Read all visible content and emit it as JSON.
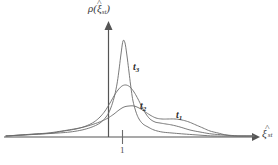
{
  "figure": {
    "background_color": "#ffffff",
    "line_color": "#6b6b6b",
    "axis_color": "#555555",
    "text_color": "#3b3b3b"
  },
  "axes": {
    "y": {
      "label_rho": "ρ(",
      "label_xi": "ξ",
      "label_hat": "˄",
      "label_sub": "st",
      "label_close": ")",
      "arrow": "up-arrow"
    },
    "x": {
      "label_xi": "ξ",
      "label_hat": "˄",
      "label_sub": "st",
      "arrow": "right-arrow"
    }
  },
  "ticks": {
    "x": [
      {
        "label": "1",
        "position": 122
      }
    ]
  },
  "curve_labels": [
    {
      "name": "t3",
      "base": "t",
      "sub": "3"
    },
    {
      "name": "t2",
      "base": "t",
      "sub": "2"
    },
    {
      "name": "t1",
      "base": "t",
      "sub": "1"
    }
  ],
  "chart_data": {
    "type": "line",
    "title": "",
    "subtitle": "",
    "xlabel": "ξ̂_st",
    "ylabel": "ρ(ξ̂_st)",
    "grid": false,
    "legend": "inline-annotations",
    "legend_entries": [
      "t₁",
      "t₂",
      "t₃"
    ],
    "axis_origin_px": {
      "x": 108,
      "y": 137
    },
    "xlim_px": [
      4,
      258
    ],
    "ylim_px": [
      137,
      24
    ],
    "annotations": [
      {
        "text": "t₃",
        "x_px": 133,
        "y_px": 62
      },
      {
        "text": "t₂",
        "x_px": 140,
        "y_px": 101
      },
      {
        "text": "t₁",
        "x_px": 176,
        "y_px": 110
      }
    ],
    "series": [
      {
        "name": "t1",
        "description": "broadest, lowest distribution with right shoulder",
        "points_px": [
          [
            6,
            136
          ],
          [
            20,
            135
          ],
          [
            34,
            134
          ],
          [
            48,
            133
          ],
          [
            62,
            131
          ],
          [
            74,
            129
          ],
          [
            84,
            127
          ],
          [
            94,
            124
          ],
          [
            102,
            121
          ],
          [
            108,
            118
          ],
          [
            114,
            114
          ],
          [
            119,
            110
          ],
          [
            124,
            107
          ],
          [
            129,
            106
          ],
          [
            134,
            106
          ],
          [
            139,
            108
          ],
          [
            144,
            111
          ],
          [
            150,
            115
          ],
          [
            156,
            118
          ],
          [
            162,
            119
          ],
          [
            168,
            119
          ],
          [
            175,
            119
          ],
          [
            182,
            120
          ],
          [
            189,
            122
          ],
          [
            196,
            125
          ],
          [
            203,
            128
          ],
          [
            210,
            131
          ],
          [
            218,
            133
          ],
          [
            226,
            135
          ],
          [
            234,
            136
          ],
          [
            244,
            136
          ],
          [
            254,
            136
          ]
        ]
      },
      {
        "name": "t2",
        "description": "intermediate peak, medium width",
        "points_px": [
          [
            6,
            136
          ],
          [
            22,
            135
          ],
          [
            38,
            134
          ],
          [
            52,
            133
          ],
          [
            64,
            131
          ],
          [
            76,
            129
          ],
          [
            86,
            126
          ],
          [
            94,
            122
          ],
          [
            100,
            117
          ],
          [
            105,
            111
          ],
          [
            110,
            103
          ],
          [
            114,
            96
          ],
          [
            118,
            90
          ],
          [
            122,
            86
          ],
          [
            126,
            85
          ],
          [
            130,
            87
          ],
          [
            134,
            92
          ],
          [
            138,
            99
          ],
          [
            142,
            107
          ],
          [
            146,
            114
          ],
          [
            150,
            119
          ],
          [
            155,
            122
          ],
          [
            160,
            123
          ],
          [
            166,
            124
          ],
          [
            172,
            125
          ],
          [
            180,
            127
          ],
          [
            190,
            130
          ],
          [
            200,
            132
          ],
          [
            212,
            134
          ],
          [
            226,
            135
          ],
          [
            240,
            136
          ],
          [
            254,
            136
          ]
        ]
      },
      {
        "name": "t3",
        "description": "tall narrow peak nearest steady-state",
        "points_px": [
          [
            6,
            136
          ],
          [
            24,
            135
          ],
          [
            42,
            134
          ],
          [
            58,
            133
          ],
          [
            70,
            132
          ],
          [
            82,
            130
          ],
          [
            92,
            127
          ],
          [
            100,
            123
          ],
          [
            106,
            117
          ],
          [
            110,
            110
          ],
          [
            114,
            98
          ],
          [
            117,
            84
          ],
          [
            119,
            70
          ],
          [
            121,
            54
          ],
          [
            123,
            41
          ],
          [
            125,
            43
          ],
          [
            127,
            56
          ],
          [
            129,
            72
          ],
          [
            131,
            88
          ],
          [
            133,
            101
          ],
          [
            136,
            112
          ],
          [
            139,
            119
          ],
          [
            143,
            124
          ],
          [
            148,
            127
          ],
          [
            154,
            130
          ],
          [
            162,
            132
          ],
          [
            172,
            133
          ],
          [
            184,
            134
          ],
          [
            198,
            135
          ],
          [
            214,
            136
          ],
          [
            234,
            136
          ],
          [
            254,
            136
          ]
        ]
      }
    ]
  }
}
